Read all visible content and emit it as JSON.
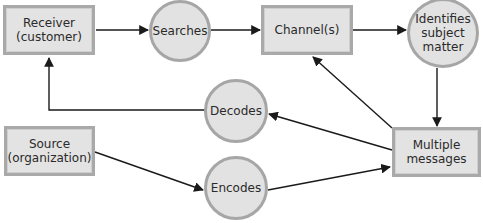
{
  "diagram": {
    "type": "flowchart",
    "title": "",
    "colors": {
      "node_fill": "#e3e3e3",
      "node_border": "#a9a9a9",
      "arrow": "#1a1a1a",
      "text": "#2a2a2a"
    },
    "nodes": {
      "receiver": {
        "shape": "rectangle",
        "label": "Receiver\n(customer)"
      },
      "searches": {
        "shape": "circle",
        "label": "Searches"
      },
      "channels": {
        "shape": "rectangle",
        "label": "Channel(s)"
      },
      "identifies": {
        "shape": "circle",
        "label": "Identifies\nsubject\nmatter"
      },
      "decodes": {
        "shape": "circle",
        "label": "Decodes"
      },
      "source": {
        "shape": "rectangle",
        "label": "Source\n(organization)"
      },
      "encodes": {
        "shape": "circle",
        "label": "Encodes"
      },
      "messages": {
        "shape": "rectangle",
        "label": "Multiple\nmessages"
      }
    },
    "edges": [
      {
        "from": "receiver",
        "to": "searches"
      },
      {
        "from": "searches",
        "to": "channels"
      },
      {
        "from": "channels",
        "to": "identifies"
      },
      {
        "from": "identifies",
        "to": "messages"
      },
      {
        "from": "messages",
        "to": "channels"
      },
      {
        "from": "messages",
        "to": "decodes"
      },
      {
        "from": "decodes",
        "to": "receiver"
      },
      {
        "from": "source",
        "to": "encodes"
      },
      {
        "from": "encodes",
        "to": "messages"
      }
    ]
  }
}
